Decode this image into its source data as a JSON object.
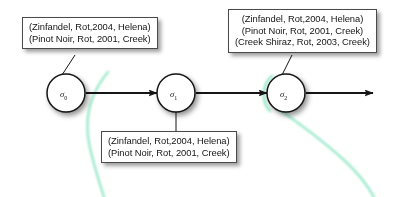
{
  "diagram": {
    "type": "state-transition-chain",
    "background_color": "#ffffff",
    "stroke_color": "#151515",
    "accent_curve_color": "#8fe6c4",
    "nodes": [
      {
        "id": "s0",
        "label": "σ",
        "subscript": "0",
        "cx": 66,
        "cy": 93,
        "r": 19
      },
      {
        "id": "s1",
        "label": "σ",
        "subscript": "1",
        "cx": 176,
        "cy": 93,
        "r": 19
      },
      {
        "id": "s2",
        "label": "σ",
        "subscript": "2",
        "cx": 286,
        "cy": 93,
        "r": 19
      }
    ],
    "edges": [
      {
        "from": "s0",
        "to": "s1",
        "arrowhead": true
      },
      {
        "from": "s1",
        "to": "s2",
        "arrowhead": true
      },
      {
        "from": "s2",
        "to": "open-end",
        "arrowhead": true
      }
    ],
    "annotations": [
      {
        "id": "box-top-left",
        "attached_to": "s0",
        "lines": [
          "(Zinfandel, Rot,2004, Helena)",
          "(Pinot Noir, Rot, 2001, Creek)"
        ]
      },
      {
        "id": "box-top-right",
        "attached_to": "s2",
        "lines": [
          "(Zinfandel, Rot,2004, Helena)",
          "(Pinot Noir, Rot, 2001, Creek)",
          "(Creek Shiraz, Rot, 2003, Creek)"
        ]
      },
      {
        "id": "box-bottom",
        "attached_to": "s1",
        "lines": [
          "(Zinfandel, Rot,2004, Helena)",
          "(Pinot Noir, Rot, 2001, Creek)"
        ]
      }
    ]
  }
}
